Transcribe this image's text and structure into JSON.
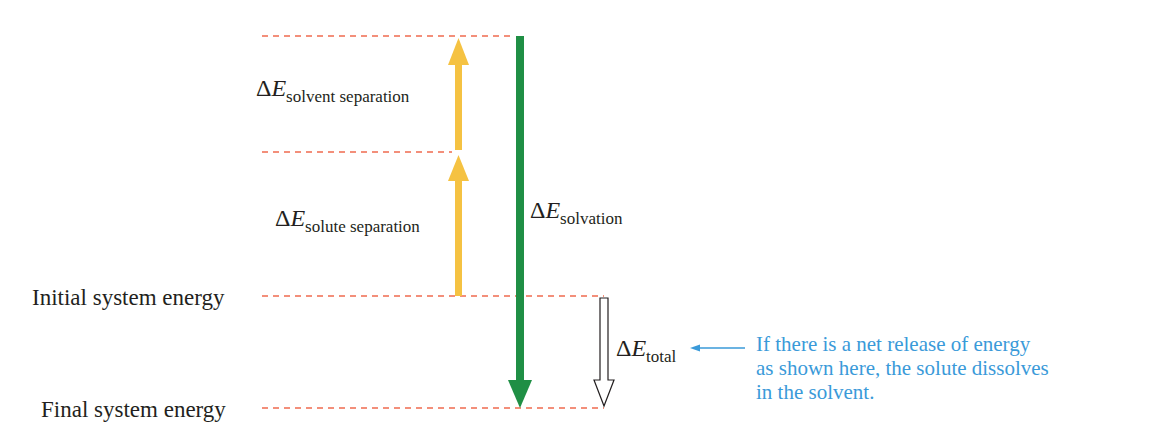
{
  "diagram": {
    "title": "",
    "levels": [
      {
        "id": "top",
        "label": ""
      },
      {
        "id": "mid",
        "label": ""
      },
      {
        "id": "initial",
        "label": "Initial system energy"
      },
      {
        "id": "final",
        "label": "Final system energy"
      }
    ],
    "arrows": {
      "solvent_separation": {
        "delta": "ΔE",
        "sub": "solvent separation",
        "direction": "up",
        "color": "#f5c242"
      },
      "solute_separation": {
        "delta": "ΔE",
        "sub": "solute separation",
        "direction": "up",
        "color": "#f5c242"
      },
      "solvation": {
        "delta": "ΔE",
        "sub": "solvation",
        "direction": "down",
        "color": "#1f8f45"
      },
      "total": {
        "delta": "ΔE",
        "sub": "total",
        "direction": "down",
        "color": "#ffffff"
      }
    },
    "note": "If there is a net release of energy\nas shown here, the solute dissolves\nin the solvent.",
    "colors": {
      "dash": "#ef6b4f",
      "note": "#3a9ad9"
    }
  }
}
